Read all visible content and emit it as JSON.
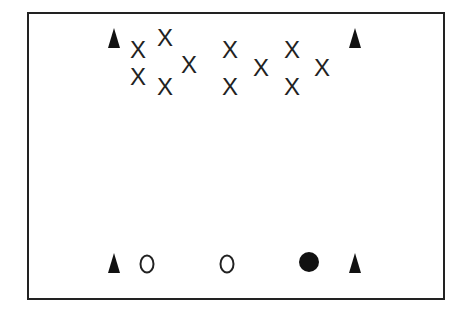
{
  "diagram": {
    "type": "drill-layout",
    "border_color": "#222222",
    "cones": [
      {
        "id": "top-left",
        "x": 114,
        "y": 38
      },
      {
        "id": "top-right",
        "x": 355,
        "y": 38
      },
      {
        "id": "bottom-left",
        "x": 114,
        "y": 263
      },
      {
        "id": "bottom-right",
        "x": 355,
        "y": 263
      }
    ],
    "crosses": [
      {
        "label": "X",
        "x": 138,
        "y": 50
      },
      {
        "label": "X",
        "x": 165,
        "y": 38
      },
      {
        "label": "X",
        "x": 189,
        "y": 65
      },
      {
        "label": "X",
        "x": 138,
        "y": 77
      },
      {
        "label": "X",
        "x": 165,
        "y": 87
      },
      {
        "label": "X",
        "x": 230,
        "y": 50
      },
      {
        "label": "X",
        "x": 230,
        "y": 87
      },
      {
        "label": "X",
        "x": 261,
        "y": 68
      },
      {
        "label": "X",
        "x": 292,
        "y": 50
      },
      {
        "label": "X",
        "x": 292,
        "y": 87
      },
      {
        "label": "X",
        "x": 322,
        "y": 68
      }
    ],
    "circles_open": [
      {
        "label": "O",
        "x": 147,
        "y": 264
      },
      {
        "label": "O",
        "x": 227,
        "y": 264
      }
    ],
    "ball": {
      "x": 309,
      "y": 262
    }
  }
}
